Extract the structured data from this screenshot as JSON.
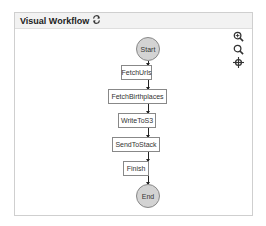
{
  "panel": {
    "title": "Visual Workflow",
    "refresh_icon": "refresh-icon"
  },
  "tools": [
    {
      "name": "zoom-in-icon"
    },
    {
      "name": "zoom-out-icon"
    },
    {
      "name": "recenter-icon"
    }
  ],
  "workflow": {
    "start": "Start",
    "steps": [
      "FetchUrls",
      "FetchBirthplaces",
      "WriteToS3",
      "SendToStack",
      "Finish"
    ],
    "end": "End"
  }
}
